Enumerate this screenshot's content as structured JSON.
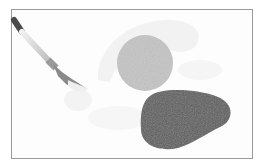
{
  "illustration": {
    "subject": "paintbrush with watercolor shapes",
    "colors": {
      "frame_border": "#9a9a9a",
      "background": "#fdfdfd",
      "light_wash": "#f1f1f1",
      "circle_fill": "#c4c4c4",
      "blob_fill": "#5f5f5f",
      "brush_handle": "#d8d8d8",
      "brush_tip_dark": "#4a4a4a",
      "brush_ferrule": "#8a8a8a"
    }
  }
}
